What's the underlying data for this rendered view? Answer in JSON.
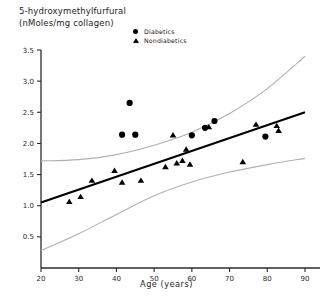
{
  "chart_data": {
    "type": "scatter",
    "title": "",
    "ylabel_lines": [
      "5-hydroxymethylfurfural",
      "(nMoles/mg collagen)"
    ],
    "ylabel": "5-hydroxymethylfurfural (nMoles/mg collagen)",
    "xlabel": "Age (years)",
    "xlim": [
      20,
      90
    ],
    "ylim": [
      0,
      3.5
    ],
    "xticks": [
      20,
      30,
      40,
      50,
      60,
      70,
      80,
      90
    ],
    "xtick_labels": [
      "20",
      "30",
      "40",
      "50",
      "60",
      "70",
      "80",
      "90"
    ],
    "yticks": [
      0.5,
      1.0,
      1.5,
      2.0,
      2.5,
      3.0,
      3.5
    ],
    "ytick_labels": [
      "0.5",
      "1.0",
      "1.5",
      "2.0",
      "2.5",
      "3.0",
      "3.5"
    ],
    "grid": false,
    "legend_position": "top-center",
    "legend": [
      {
        "label": "Diabetics",
        "marker": "filled-circle",
        "color": "#000000"
      },
      {
        "label": "Nondiabetics",
        "marker": "filled-triangle",
        "color": "#000000"
      }
    ],
    "series": [
      {
        "name": "Diabetics",
        "marker": "filled-circle",
        "color": "#000000",
        "points": [
          {
            "x": 41.5,
            "y": 2.14
          },
          {
            "x": 43.5,
            "y": 2.65
          },
          {
            "x": 45.0,
            "y": 2.14
          },
          {
            "x": 60.0,
            "y": 2.13
          },
          {
            "x": 63.5,
            "y": 2.25
          },
          {
            "x": 66.0,
            "y": 2.36
          },
          {
            "x": 79.5,
            "y": 2.11
          }
        ]
      },
      {
        "name": "Nondiabetics",
        "marker": "filled-triangle",
        "color": "#000000",
        "points": [
          {
            "x": 27.5,
            "y": 1.06
          },
          {
            "x": 30.5,
            "y": 1.14
          },
          {
            "x": 33.5,
            "y": 1.4
          },
          {
            "x": 39.5,
            "y": 1.56
          },
          {
            "x": 41.5,
            "y": 1.37
          },
          {
            "x": 46.5,
            "y": 1.4
          },
          {
            "x": 53.0,
            "y": 1.62
          },
          {
            "x": 56.0,
            "y": 1.68
          },
          {
            "x": 57.5,
            "y": 1.72
          },
          {
            "x": 58.5,
            "y": 1.9
          },
          {
            "x": 59.5,
            "y": 1.66
          },
          {
            "x": 55.0,
            "y": 2.13
          },
          {
            "x": 64.5,
            "y": 2.26
          },
          {
            "x": 73.5,
            "y": 1.7
          },
          {
            "x": 77.0,
            "y": 2.3
          },
          {
            "x": 82.5,
            "y": 2.28
          },
          {
            "x": 83.0,
            "y": 2.2
          }
        ]
      }
    ],
    "regression_line": {
      "name": "fitted-regression",
      "color": "#000000",
      "x_start": 20,
      "y_start": 1.05,
      "x_end": 90,
      "y_end": 2.5
    },
    "confidence_bands": {
      "name": "confidence-interval",
      "color": "#b0b0b0",
      "upper": [
        {
          "x": 20,
          "y": 1.72
        },
        {
          "x": 30,
          "y": 1.74
        },
        {
          "x": 40,
          "y": 1.82
        },
        {
          "x": 50,
          "y": 1.97
        },
        {
          "x": 60,
          "y": 2.18
        },
        {
          "x": 70,
          "y": 2.48
        },
        {
          "x": 80,
          "y": 2.88
        },
        {
          "x": 90,
          "y": 3.4
        }
      ],
      "lower": [
        {
          "x": 20,
          "y": 0.28
        },
        {
          "x": 30,
          "y": 0.55
        },
        {
          "x": 40,
          "y": 0.86
        },
        {
          "x": 50,
          "y": 1.16
        },
        {
          "x": 60,
          "y": 1.38
        },
        {
          "x": 70,
          "y": 1.54
        },
        {
          "x": 80,
          "y": 1.66
        },
        {
          "x": 90,
          "y": 1.76
        }
      ]
    }
  },
  "axes": {
    "x_axis_name": "age-axis",
    "y_axis_name": "hmf-axis"
  }
}
